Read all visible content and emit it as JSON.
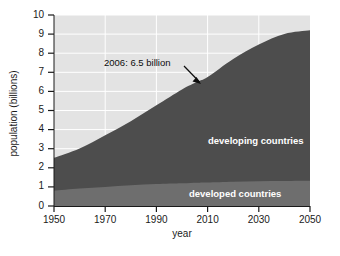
{
  "chart_data": {
    "type": "area",
    "title": "",
    "subtitle": "",
    "xlabel": "year",
    "ylabel": "population (billions)",
    "xlim": [
      1950,
      2050
    ],
    "ylim": [
      0,
      10
    ],
    "grid": true,
    "stacked": true,
    "legend_position": "inline-labels",
    "xticks": [
      1950,
      1970,
      1990,
      2010,
      2030,
      2050
    ],
    "xtick_labels": [
      "1950",
      "1970",
      "1990",
      "2010",
      "2030",
      "2050"
    ],
    "yticks": [
      0,
      1,
      2,
      3,
      4,
      5,
      6,
      7,
      8,
      9,
      10
    ],
    "ytick_labels": [
      "0",
      "1",
      "2",
      "3",
      "4",
      "5",
      "6",
      "7",
      "8",
      "9",
      "10"
    ],
    "x": [
      1950,
      1960,
      1970,
      1980,
      1990,
      2000,
      2006,
      2010,
      2020,
      2030,
      2040,
      2050
    ],
    "series": [
      {
        "name": "developed countries",
        "color": "#6e6e6e",
        "label_text": "developed countries",
        "values": [
          0.81,
          0.92,
          1.0,
          1.08,
          1.15,
          1.19,
          1.22,
          1.23,
          1.27,
          1.3,
          1.31,
          1.32
        ]
      },
      {
        "name": "developing countries",
        "color": "#4d4d4d",
        "label_text": "developing countries",
        "values": [
          1.71,
          2.09,
          2.7,
          3.36,
          4.12,
          4.91,
          5.28,
          5.52,
          6.43,
          7.16,
          7.7,
          7.88
        ]
      }
    ],
    "totals": [
      2.52,
      3.01,
      3.7,
      4.44,
      5.27,
      6.1,
      6.5,
      6.75,
      7.7,
      8.46,
      9.01,
      9.2
    ],
    "annotations": [
      {
        "text": "2006: 6.5 billion",
        "point_x": 2006,
        "point_y": 6.5,
        "arrow": true
      }
    ],
    "colors": {
      "plot_background": "#e3e3e3",
      "grid": "#ffffff",
      "developed": "#6e6e6e",
      "developing": "#4d4d4d",
      "axis_text": "#1a1a1a",
      "series_label_text": "#ffffff",
      "annotation_text": "#0d0d0d"
    }
  }
}
